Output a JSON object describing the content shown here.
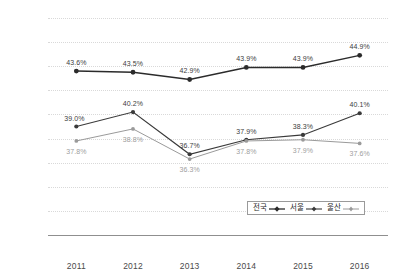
{
  "chart_data": {
    "type": "line",
    "title": "",
    "xlabel": "",
    "ylabel": "",
    "categories": [
      "2011",
      "2012",
      "2013",
      "2014",
      "2015",
      "2016"
    ],
    "ylim": [
      30.0,
      48.0
    ],
    "ytick_labels": [
      "48.0",
      "46.0",
      "44.0",
      "42.0",
      "40.0",
      "38.0",
      "36.0",
      "34.0",
      "32.0",
      "30.0"
    ],
    "ytick_values": [
      48.0,
      46.0,
      44.0,
      42.0,
      40.0,
      38.0,
      36.0,
      34.0,
      32.0,
      30.0
    ],
    "grid": true,
    "legend_position": "inside-bottom-right",
    "series": [
      {
        "name": "전국",
        "color": "#2b2b2b",
        "values": [
          43.6,
          43.5,
          42.9,
          43.9,
          43.9,
          44.9
        ],
        "labels": [
          "43.6%",
          "43.5%",
          "42.9%",
          "43.9%",
          "43.9%",
          "44.9%"
        ],
        "label_positions": [
          "above",
          "above",
          "above",
          "above",
          "above",
          "above"
        ]
      },
      {
        "name": "서울",
        "color": "#3a3a3a",
        "values": [
          39.0,
          40.2,
          36.7,
          37.9,
          38.3,
          40.1
        ],
        "labels": [
          "39.0%",
          "40.2%",
          "36.7%",
          "37.9%",
          "38.3%",
          "40.1%"
        ],
        "label_positions": [
          "left-above",
          "above",
          "above",
          "above",
          "above",
          "above"
        ]
      },
      {
        "name": "울산",
        "color": "#9a9a9a",
        "values": [
          37.8,
          38.8,
          36.3,
          37.8,
          37.9,
          37.6
        ],
        "labels": [
          "37.8%",
          "38.8%",
          "36.3%",
          "37.8%",
          "37.9%",
          "37.6%"
        ],
        "label_positions": [
          "below",
          "below",
          "below",
          "below",
          "below",
          "below"
        ]
      }
    ]
  },
  "legend": {
    "items": [
      {
        "label": "전국",
        "marker": "line-marker-diamond"
      },
      {
        "label": "서울",
        "marker": "line-marker-diamond"
      },
      {
        "label": "울산",
        "marker": "line-marker-diamond"
      }
    ]
  },
  "axis": {
    "x_labels": [
      "2011",
      "2012",
      "2013",
      "2014",
      "2015",
      "2016"
    ],
    "y_labels": [
      "48.0",
      "46.0",
      "44.0",
      "42.0",
      "40.0",
      "38.0",
      "36.0",
      "34.0",
      "32.0",
      "30.0"
    ]
  }
}
